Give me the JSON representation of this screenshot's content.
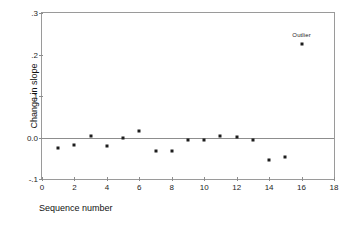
{
  "chart_data": {
    "type": "scatter",
    "title": "",
    "xlabel": "Sequence number",
    "ylabel": "Change in slope",
    "xlim": [
      0,
      18
    ],
    "ylim": [
      -0.1,
      0.3
    ],
    "xticks": [
      0,
      2,
      4,
      6,
      8,
      10,
      12,
      14,
      16,
      18
    ],
    "xtick_labels": [
      "0",
      "2",
      "4",
      "6",
      "8",
      "10",
      "12",
      "14",
      "16",
      "18"
    ],
    "yticks": [
      -0.1,
      0.0,
      0.1,
      0.2,
      0.3
    ],
    "ytick_labels": [
      "-.1",
      "0.0",
      ".1",
      ".2",
      ".3"
    ],
    "grid": false,
    "legend": null,
    "reference_lines": [
      {
        "axis": "y",
        "value": 0.0,
        "style": "solid"
      }
    ],
    "x": [
      1,
      2,
      3,
      4,
      5,
      6,
      7,
      8,
      9,
      10,
      11,
      12,
      13,
      14,
      15,
      16
    ],
    "values": [
      -0.025,
      -0.018,
      0.004,
      -0.02,
      0.0,
      0.016,
      -0.033,
      -0.033,
      -0.007,
      -0.007,
      0.003,
      0.002,
      -0.006,
      -0.055,
      -0.047,
      0.225
    ],
    "points": [
      {
        "x": 1,
        "y": -0.025,
        "label": ""
      },
      {
        "x": 2,
        "y": -0.018,
        "label": ""
      },
      {
        "x": 3,
        "y": 0.004,
        "label": ""
      },
      {
        "x": 4,
        "y": -0.02,
        "label": ""
      },
      {
        "x": 5,
        "y": 0.0,
        "label": ""
      },
      {
        "x": 6,
        "y": 0.016,
        "label": ""
      },
      {
        "x": 7,
        "y": -0.033,
        "label": ""
      },
      {
        "x": 8,
        "y": -0.033,
        "label": ""
      },
      {
        "x": 9,
        "y": -0.007,
        "label": ""
      },
      {
        "x": 10,
        "y": -0.007,
        "label": ""
      },
      {
        "x": 11,
        "y": 0.003,
        "label": ""
      },
      {
        "x": 12,
        "y": 0.002,
        "label": ""
      },
      {
        "x": 13,
        "y": -0.006,
        "label": ""
      },
      {
        "x": 14,
        "y": -0.055,
        "label": ""
      },
      {
        "x": 15,
        "y": -0.047,
        "label": ""
      },
      {
        "x": 16,
        "y": 0.225,
        "label": "Outlier"
      }
    ],
    "annotations": [
      {
        "text": "Outlier",
        "x": 16,
        "y": 0.225
      }
    ],
    "marker_color": "#1d1d1d",
    "axis_color": "#8d8d8d",
    "background_color": "#ffffff"
  }
}
